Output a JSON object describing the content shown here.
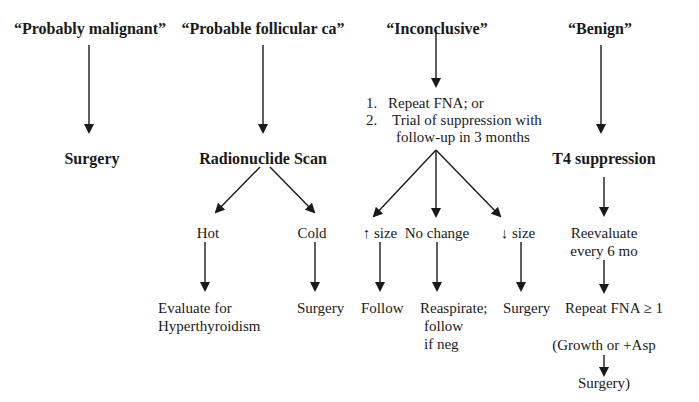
{
  "diagram": {
    "type": "flowchart",
    "columns": [
      {
        "header": "“Probably malignant”",
        "next": "Surgery"
      },
      {
        "header": "“Probable follicular ca”",
        "next": "Radionuclide Scan",
        "branches": [
          {
            "label": "Hot",
            "outcome_lines": [
              "Evaluate for",
              "Hyperthyroidism"
            ]
          },
          {
            "label": "Cold",
            "outcome_lines": [
              "Surgery"
            ]
          }
        ]
      },
      {
        "header": "“Inconclusive”",
        "options": [
          {
            "num": "1.",
            "text": "Repeat FNA; or"
          },
          {
            "num": "2.",
            "text": "Trial of suppression with"
          },
          {
            "num": "",
            "text": "follow-up in 3 months"
          }
        ],
        "branches": [
          {
            "label": "↑ size",
            "outcome_lines": [
              "Follow"
            ]
          },
          {
            "label": "No change",
            "outcome_lines": [
              "Reaspirate;",
              "follow",
              "if neg"
            ]
          },
          {
            "label": "↓ size",
            "outcome_lines": [
              "Surgery"
            ]
          }
        ]
      },
      {
        "header": "“Benign”",
        "next": "T4 suppression",
        "steps": [
          "Reevaluate",
          "every 6 mo",
          "Repeat FNA ≥ 1",
          "(Growth or +Asp",
          "Surgery)"
        ]
      }
    ]
  }
}
